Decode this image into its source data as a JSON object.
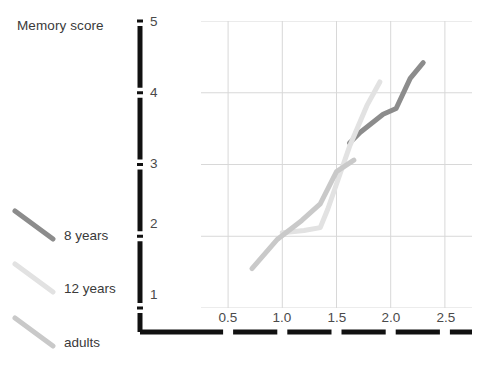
{
  "figure": {
    "width": 484,
    "height": 383,
    "background": "#ffffff"
  },
  "chart_data": {
    "type": "line",
    "title": "",
    "ylabel": "Memory score",
    "xlabel": "",
    "xlim": [
      0.25,
      2.75
    ],
    "ylim": [
      1,
      5
    ],
    "xticks": [
      "0.5",
      "1.0",
      "1.5",
      "2.0",
      "2.5"
    ],
    "xtick_values": [
      0.5,
      1.0,
      1.5,
      2.0,
      2.5
    ],
    "yticks": [
      "1",
      "2",
      "3",
      "4",
      "5"
    ],
    "ytick_values": [
      1,
      2,
      3,
      4,
      5
    ],
    "grid": true,
    "grid_color": "#d8d8d8",
    "legend_position": "left-outside",
    "series": [
      {
        "name": "8 years",
        "color": "#8c8c8c",
        "x": [
          1.62,
          1.72,
          1.93,
          2.05,
          2.18,
          2.3
        ],
        "y": [
          3.3,
          3.45,
          3.7,
          3.78,
          4.2,
          4.42
        ]
      },
      {
        "name": "12 years",
        "color": "#e2e2e2",
        "x": [
          1.0,
          1.2,
          1.35,
          1.42,
          1.62,
          1.78,
          1.9
        ],
        "y": [
          2.05,
          2.08,
          2.12,
          2.38,
          3.25,
          3.82,
          4.15
        ]
      },
      {
        "name": "adults",
        "color": "#c9c9c9",
        "x": [
          0.72,
          0.95,
          1.18,
          1.35,
          1.5,
          1.66
        ],
        "y": [
          1.55,
          1.95,
          2.22,
          2.45,
          2.9,
          3.06
        ]
      }
    ]
  },
  "axes": {
    "color": "#111111",
    "y_axis_label": "Memory score"
  },
  "legend": {
    "entries": [
      {
        "label": "8 years",
        "color": "#8c8c8c"
      },
      {
        "label": "12 years",
        "color": "#e2e2e2"
      },
      {
        "label": "adults",
        "color": "#c9c9c9"
      }
    ]
  }
}
